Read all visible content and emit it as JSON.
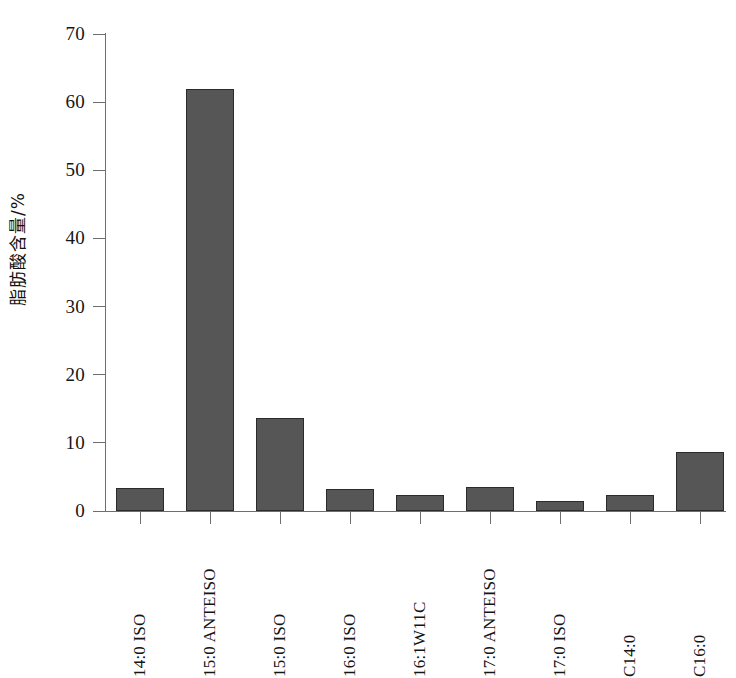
{
  "chart_data": {
    "type": "bar",
    "title": "",
    "subtitle": "",
    "xlabel": "",
    "ylabel": "脂肪酸含量/%",
    "ylim": [
      0,
      70
    ],
    "yticks": [
      0,
      10,
      20,
      30,
      40,
      50,
      60,
      70
    ],
    "ytick_labels": [
      "0",
      "10",
      "20",
      "30",
      "40",
      "50",
      "60",
      "70"
    ],
    "grid": false,
    "legend": null,
    "legend_position": "none",
    "bar_color": "#565656",
    "bar_edge_color": "#2b2b2b",
    "axis_color": "#6e6e6e",
    "categories": [
      "14:0 ISO",
      "15:0 ANTEISO",
      "15:0 ISO",
      "16:0 ISO",
      "16:1W11C",
      "17:0 ANTEISO",
      "17:0 ISO",
      "C14:0",
      "C16:0"
    ],
    "values": [
      3.4,
      61.9,
      13.6,
      3.3,
      2.3,
      3.5,
      1.4,
      2.3,
      8.6
    ],
    "series": [
      {
        "name": "脂肪酸含量",
        "values": [
          3.4,
          61.9,
          13.6,
          3.3,
          2.3,
          3.5,
          1.4,
          2.3,
          8.6
        ]
      }
    ]
  }
}
